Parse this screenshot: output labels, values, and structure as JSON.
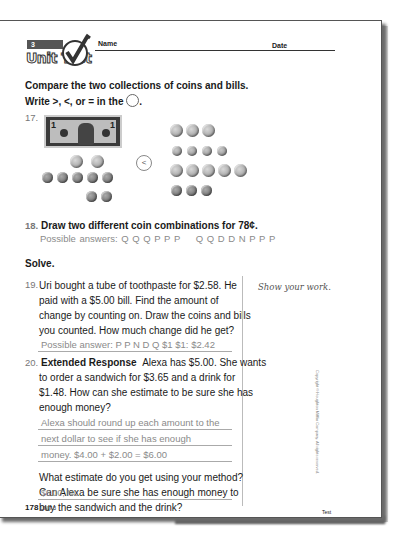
{
  "header": {
    "unit_number": "3",
    "unit_title": "Unit Test",
    "name_label": "Name",
    "date_label": "Date"
  },
  "section1": {
    "instruction_line1": "Compare the two collections of coins and bills.",
    "instruction_line2": "Write >, <, or = in the",
    "instruction_end": "."
  },
  "q17": {
    "number": "17.",
    "left_collection": {
      "bills": [
        "$1"
      ],
      "coins": [
        "Q",
        "Q",
        "P",
        "P",
        "P",
        "P",
        "P",
        "P",
        "P"
      ]
    },
    "right_collection": {
      "coins": [
        "Q",
        "Q",
        "Q",
        "D",
        "D",
        "D",
        "D",
        "Q",
        "Q",
        "Q",
        "Q",
        "Q",
        "P",
        "P",
        "P"
      ]
    },
    "comparison_answer": "<"
  },
  "q18": {
    "number": "18.",
    "text": "Draw two different coin combinations for 78¢.",
    "answer_label": "Possible answers:",
    "answer_a": "Q Q Q P P P",
    "answer_b": "Q Q D D N P P P"
  },
  "solve_heading": "Solve.",
  "q19": {
    "number": "19.",
    "lines": [
      "Uri bought a tube of toothpaste for $2.58. He",
      "paid with a $5.00 bill. Find the amount of",
      "change by counting on. Draw the coins and bills",
      "you counted. How much change did he get?"
    ],
    "answer": "Possible answer: P P N D Q $1 $1: $2.42"
  },
  "show_work": "Show your work.",
  "q20": {
    "number": "20.",
    "label": "Extended Response",
    "lines": [
      "Alexa has $5.00. She wants",
      "to order a sandwich for $3.65 and a drink for",
      "$1.48. How can she estimate to be sure she has",
      "enough money?"
    ],
    "answer_lines": [
      "Alexa should round up each amount to the",
      "next dollar to see if she has enough",
      "money. $4.00 + $2.00 = $6.00"
    ],
    "followup_lines": [
      "What estimate do you get using your method?",
      "Can Alexa be sure she has enough money to",
      "buy the sandwich and the drink?"
    ],
    "followup_answer": "$6.00; No"
  },
  "copyright": "Copyright © Houghton Mifflin Company. All rights reserved.",
  "footer": {
    "page_number": "178",
    "unit": "UNIT 3",
    "right": "Test"
  }
}
